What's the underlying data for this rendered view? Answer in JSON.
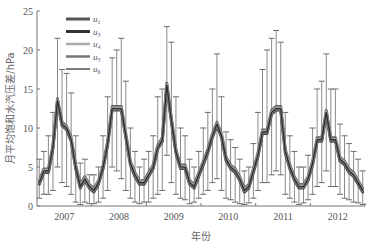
{
  "chart_data": {
    "type": "line",
    "title": "",
    "xlabel": "年份",
    "ylabel": "月平均饱和水汽压差/hPa",
    "ylim": [
      0,
      25
    ],
    "yticks": [
      0,
      5,
      10,
      15,
      20,
      25
    ],
    "xtick_labels": [
      "2007",
      "2008",
      "2009",
      "2010",
      "2011",
      "2012"
    ],
    "grid": false,
    "legend_position": "upper-left",
    "legend": [
      {
        "name": "u1",
        "base": "u",
        "sub": "1",
        "color": "#555555",
        "width": 3
      },
      {
        "name": "u3",
        "base": "u",
        "sub": "3",
        "color": "#333333",
        "width": 3
      },
      {
        "name": "u4",
        "base": "u",
        "sub": "4",
        "color": "#aaaaaa",
        "width": 2.5
      },
      {
        "name": "u5",
        "base": "u",
        "sub": "5",
        "color": "#777777",
        "width": 2.5
      },
      {
        "name": "u6",
        "base": "u",
        "sub": "6",
        "color": "#222222",
        "width": 1.2
      }
    ],
    "x_months": "2007-01 to 2012-12 (monthly)",
    "mean": [
      3,
      4.5,
      4.5,
      7.5,
      13.5,
      10.5,
      10,
      8.5,
      5,
      2.5,
      3.5,
      2.5,
      2,
      3,
      5,
      8,
      12.5,
      12.5,
      12.5,
      9,
      5.5,
      4,
      3,
      3,
      4,
      5,
      7.5,
      8.5,
      15.5,
      11,
      7,
      5,
      5,
      3,
      2.5,
      4,
      5.5,
      7,
      9,
      10.5,
      9,
      6,
      5,
      4.5,
      3.5,
      2,
      2.5,
      4.5,
      6.5,
      9.5,
      9.5,
      12,
      12.5,
      12.5,
      7,
      5,
      3.5,
      2.5,
      2.5,
      3.5,
      5.5,
      8.5,
      8.5,
      12,
      8.5,
      8.5,
      6,
      5.5,
      4.5,
      4,
      3,
      2
    ],
    "err_upper": [
      6,
      7,
      9,
      12,
      21.5,
      17.5,
      17,
      14.5,
      9,
      5.5,
      6,
      4,
      4,
      5,
      9,
      14,
      19,
      20,
      21.5,
      16,
      10,
      7,
      5,
      6,
      7,
      9,
      14,
      15,
      23,
      21,
      14,
      10,
      9,
      6,
      5,
      7,
      10,
      12,
      15,
      19.5,
      14,
      9.5,
      8.5,
      7.5,
      6,
      4.5,
      5,
      8,
      12,
      17.5,
      20,
      21.5,
      22.5,
      21,
      12,
      9,
      7,
      5,
      5,
      6.5,
      10,
      15,
      16,
      19.5,
      15,
      15,
      10.5,
      9,
      8,
      7,
      6,
      4.5
    ],
    "err_lower": [
      1,
      1.5,
      1.5,
      2,
      5,
      3,
      2.5,
      1.5,
      0.5,
      0.2,
      0.5,
      0.3,
      0.3,
      0.5,
      1,
      2,
      5,
      4.5,
      3.5,
      2,
      1,
      0.5,
      0.3,
      0.5,
      0.5,
      1,
      1.5,
      2,
      6.5,
      3,
      1.5,
      1,
      0.8,
      0.3,
      0.5,
      1,
      1.5,
      2,
      3,
      3.5,
      2,
      1,
      0.8,
      0.5,
      0.3,
      0.2,
      0.4,
      1,
      2,
      3,
      3,
      4,
      4.5,
      4,
      1.5,
      1,
      0.5,
      0.2,
      0.4,
      0.8,
      1.5,
      2.5,
      3,
      4.5,
      2.5,
      2.5,
      1.5,
      1,
      0.8,
      0.5,
      0.4,
      0.2
    ]
  },
  "axes": {
    "y_label": "月平均饱和水汽压差/hPa",
    "x_label": "年份"
  }
}
